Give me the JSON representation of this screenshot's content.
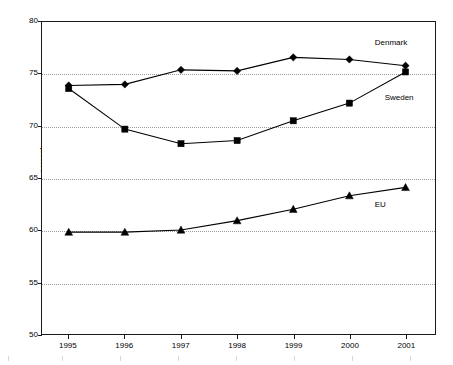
{
  "chart_data": {
    "type": "line",
    "title": "",
    "xlabel": "",
    "ylabel": "percent",
    "categories": [
      "1995",
      "1996",
      "1997",
      "1998",
      "1999",
      "2000",
      "2001"
    ],
    "ylim": [
      50,
      80
    ],
    "yticks": [
      50,
      55,
      60,
      65,
      70,
      75,
      80
    ],
    "grid": "horizontal-dotted",
    "legend_position": "inline-right",
    "series": [
      {
        "name": "Denmark",
        "marker": "diamond",
        "color": "#000000",
        "values": [
          73.9,
          74.0,
          75.4,
          75.3,
          76.6,
          76.4,
          75.8
        ]
      },
      {
        "name": "Sweden",
        "marker": "square",
        "color": "#000000",
        "values": [
          73.6,
          69.7,
          68.3,
          68.6,
          70.5,
          72.2,
          75.2
        ]
      },
      {
        "name": "EU",
        "marker": "triangle",
        "color": "#000000",
        "values": [
          59.8,
          59.8,
          60.0,
          60.9,
          62.0,
          63.3,
          64.1
        ]
      }
    ],
    "annotations": [
      {
        "text": "Denmark",
        "x_frac": 0.845,
        "y_value": 77.9
      },
      {
        "text": "Sweden",
        "x_frac": 0.87,
        "y_value": 72.6
      },
      {
        "text": "EU",
        "x_frac": 0.845,
        "y_value": 62.4
      }
    ]
  }
}
